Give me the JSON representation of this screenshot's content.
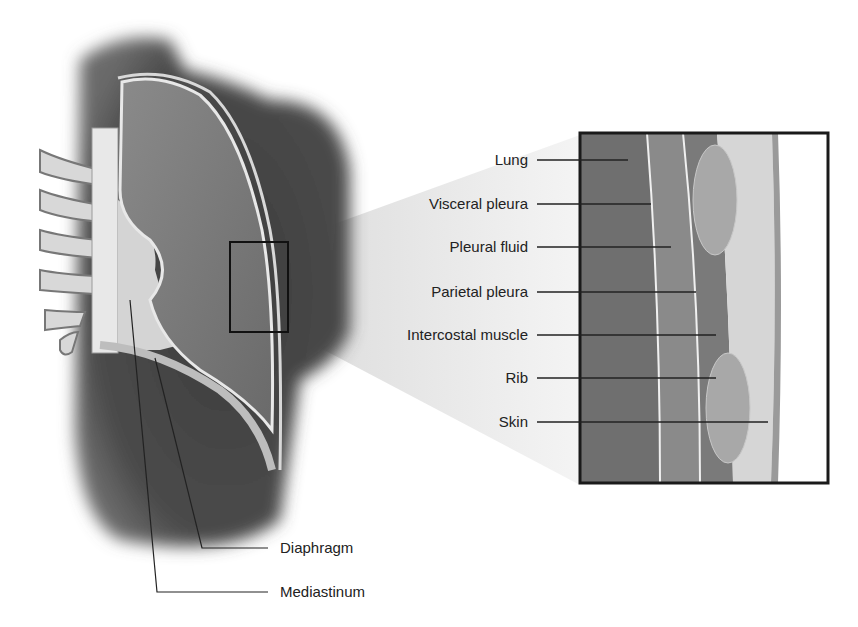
{
  "figure": {
    "callout_labels": [
      {
        "id": "lung",
        "text": "Lung",
        "y": 160
      },
      {
        "id": "visceral-pleura",
        "text": "Visceral pleura",
        "y": 204
      },
      {
        "id": "pleural-fluid",
        "text": "Pleural fluid",
        "y": 247
      },
      {
        "id": "parietal-pleura",
        "text": "Parietal pleura",
        "y": 292
      },
      {
        "id": "intercostal-muscle",
        "text": "Intercostal muscle",
        "y": 335
      },
      {
        "id": "rib",
        "text": "Rib",
        "y": 378
      },
      {
        "id": "skin",
        "text": "Skin",
        "y": 422
      }
    ],
    "bottom_labels": [
      {
        "id": "diaphragm",
        "text": "Diaphragm",
        "y": 548
      },
      {
        "id": "mediastinum",
        "text": "Mediastinum",
        "y": 592
      }
    ],
    "colors": {
      "dark_tissue": "#4a4a4a",
      "lung": "#7a7a7a",
      "pleura_line": "#e8e8e8",
      "inset_border": "#1a1a1a",
      "label_text": "#222222"
    }
  }
}
